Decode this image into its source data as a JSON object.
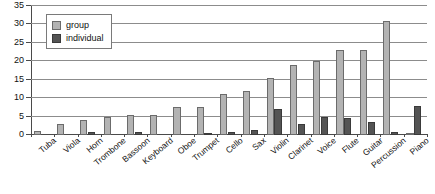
{
  "chart_data": {
    "type": "bar",
    "title": "",
    "subtitle": "",
    "xlabel": "",
    "ylabel": "",
    "ylim": [
      0,
      35
    ],
    "ytick_labels": [
      "0",
      "5",
      "10",
      "15",
      "20",
      "25",
      "30",
      "35"
    ],
    "yticks": [
      0,
      5,
      10,
      15,
      20,
      25,
      30,
      35
    ],
    "grid": true,
    "legend_position": "top-left",
    "categories": [
      "Tuba",
      "Viola",
      "Horn",
      "Trombone",
      "Bassoon",
      "Keyboard",
      "Oboe",
      "Trumpet",
      "Cello",
      "Sax",
      "Violin",
      "Clarinet",
      "Voice",
      "Flute",
      "Guitar",
      "Percussion",
      "Piano"
    ],
    "series": [
      {
        "name": "group",
        "color": "#b3b3b3",
        "values": [
          1,
          3,
          4,
          4.8,
          5.5,
          5.4,
          7.5,
          7.5,
          11,
          12,
          15.5,
          19,
          20,
          23,
          23,
          31,
          0.5
        ]
      },
      {
        "name": "individual",
        "color": "#545454",
        "values": [
          0,
          0,
          0.9,
          0,
          0.8,
          0,
          0,
          0.6,
          0.8,
          1.3,
          7,
          3,
          5,
          4.5,
          3.5,
          0.8,
          8
        ]
      }
    ]
  },
  "legend": {
    "items": [
      {
        "label": "group",
        "swatch": "group"
      },
      {
        "label": "individual",
        "swatch": "individual"
      }
    ]
  }
}
